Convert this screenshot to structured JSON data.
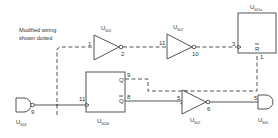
{
  "note": {
    "line1": "Modified wiring",
    "line2": "shown dotted"
  },
  "components": {
    "inv1": {
      "ref": "U",
      "sub": "602",
      "pin_in": "1",
      "pin_out": "2"
    },
    "inv2": {
      "ref": "U",
      "sub": "602",
      "pin_in": "11",
      "pin_out": "10"
    },
    "ff_a": {
      "ref": "U",
      "sub": "601a",
      "pin_clk": "3",
      "pin_r": "1",
      "r_label": "R"
    },
    "ff_b": {
      "ref": "U",
      "sub": "601b",
      "pin_clk": "11",
      "pin_q": "9",
      "pin_qbar": "8",
      "q_label": "Q",
      "qbar_label": "Q"
    },
    "gate_in": {
      "ref": "U",
      "sub": "604",
      "pin_out": "9"
    },
    "inv3": {
      "ref": "U",
      "sub": "602",
      "pin_in": "5",
      "pin_out": "6"
    },
    "gate_out": {
      "ref": "U",
      "sub": "605",
      "pin_in": "5"
    }
  },
  "colors": {
    "line": "#555555",
    "text": "#333333",
    "background": "#ffffff"
  }
}
